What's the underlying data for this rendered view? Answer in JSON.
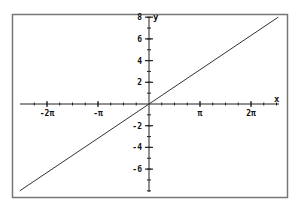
{
  "chart_data": {
    "type": "line",
    "title": "",
    "xlabel": "x",
    "ylabel": "y",
    "function": "y = x",
    "xlim": [
      -8.2,
      8.2
    ],
    "ylim": [
      -8,
      8
    ],
    "grid": false,
    "legend": null,
    "x_ticks": [
      {
        "value": -6.2832,
        "label": "-2π"
      },
      {
        "value": -3.1416,
        "label": "-π"
      },
      {
        "value": 3.1416,
        "label": "π"
      },
      {
        "value": 6.2832,
        "label": "2π"
      }
    ],
    "x_minor_step": 0.7854,
    "y_ticks": [
      {
        "value": 8,
        "label": "8"
      },
      {
        "value": 6,
        "label": "6"
      },
      {
        "value": 4,
        "label": "4"
      },
      {
        "value": 2,
        "label": "2"
      },
      {
        "value": -2,
        "label": "-2"
      },
      {
        "value": -4,
        "label": "-4"
      },
      {
        "value": -6,
        "label": "-6"
      }
    ],
    "y_minor_step": 1,
    "series": [
      {
        "name": "y = x",
        "x": [
          -7.96,
          7.96
        ],
        "y": [
          -8.0,
          8.0
        ],
        "color": "#333333"
      }
    ]
  },
  "colors": {
    "frame": "#777777",
    "axis": "#222222",
    "line": "#333333",
    "background": "#ffffff"
  }
}
